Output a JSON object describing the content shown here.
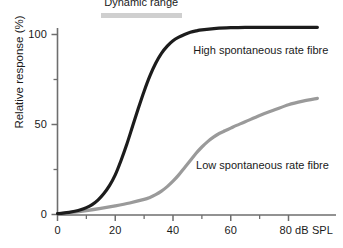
{
  "chart_data": {
    "type": "line",
    "title": "",
    "xlabel": "dB SPL",
    "ylabel": "Relative response (%)",
    "xlim": [
      -2,
      92
    ],
    "ylim": [
      -3,
      112
    ],
    "grid": false,
    "legend_position": "inline-annotation",
    "x_ticks": [
      0,
      20,
      40,
      60,
      80
    ],
    "x_tick_labels": [
      "0",
      "20",
      "40",
      "60",
      "80 dB SPL"
    ],
    "x_minor_ticks": [
      10,
      30,
      50,
      70
    ],
    "y_ticks": [
      0,
      50,
      100
    ],
    "y_tick_labels": [
      "0",
      "50",
      "100"
    ],
    "y_minor_ticks": [
      25,
      75
    ],
    "series": [
      {
        "name": "High spontaneous rate fibre",
        "color": "#1c1c1c",
        "label_x": 47,
        "label_y": 91,
        "x": [
          0,
          2,
          4,
          6,
          8,
          10,
          12,
          14,
          16,
          18,
          20,
          22,
          24,
          26,
          28,
          30,
          32,
          34,
          36,
          38,
          40,
          42,
          44,
          46,
          48,
          50,
          55,
          60,
          65,
          70,
          75,
          80,
          85,
          90
        ],
        "values": [
          0.5,
          0.8,
          1.2,
          1.8,
          2.6,
          3.8,
          5.5,
          8.0,
          11.5,
          16.0,
          22.0,
          30.0,
          39.0,
          49.0,
          59.0,
          68.5,
          77.0,
          84.0,
          89.5,
          93.5,
          96.5,
          98.5,
          100.0,
          101.2,
          102.0,
          102.6,
          103.4,
          103.8,
          104.0,
          104.0,
          104.0,
          104.0,
          104.0,
          104.0
        ]
      },
      {
        "name": "Low spontaneous rate fibre",
        "color": "#9a9a9a",
        "label_x": 48,
        "label_y": 27,
        "x": [
          0,
          5,
          10,
          15,
          20,
          25,
          30,
          32,
          34,
          36,
          38,
          40,
          42,
          44,
          46,
          48,
          50,
          52,
          54,
          56,
          58,
          60,
          62,
          65,
          70,
          75,
          80,
          85,
          90
        ],
        "values": [
          0.4,
          1.2,
          2.2,
          3.4,
          4.8,
          6.4,
          8.4,
          9.5,
          11.0,
          13.0,
          15.5,
          18.5,
          22.0,
          26.0,
          30.0,
          34.0,
          37.5,
          40.5,
          43.0,
          45.0,
          46.5,
          48.0,
          49.5,
          51.5,
          55.0,
          58.0,
          61.0,
          63.0,
          64.5
        ]
      }
    ],
    "annotations": [
      {
        "name": "dynamic-range",
        "text": "Dynamic range",
        "bar_x_start": 15,
        "bar_x_end": 43,
        "bar_y": 112
      }
    ]
  },
  "axes": {
    "y_label": "Relative response (%)",
    "tick_100": "100",
    "tick_50": "50",
    "tick_y0": "0",
    "tick_x0": "0",
    "tick_x20": "20",
    "tick_x40": "40",
    "tick_x60": "60",
    "tick_x80": "80 dB SPL"
  },
  "annotation": {
    "dynamic_range": "Dynamic range"
  },
  "labels": {
    "high_fibre": "High spontaneous rate fibre",
    "low_fibre": "Low spontaneous rate fibre"
  },
  "colors": {
    "high_fibre_curve": "#1c1c1c",
    "low_fibre_curve": "#9a9a9a",
    "axis": "#6e6e6e",
    "annotation_bar": "#cfcfcf",
    "text": "#1a1a1a",
    "background": "#ffffff"
  }
}
